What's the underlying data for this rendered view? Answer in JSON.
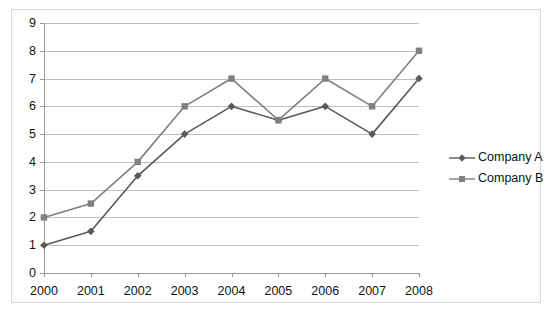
{
  "chart_data": {
    "type": "line",
    "title": "",
    "xlabel": "",
    "ylabel": "",
    "categories": [
      "2000",
      "2001",
      "2002",
      "2003",
      "2004",
      "2005",
      "2006",
      "2007",
      "2008"
    ],
    "series": [
      {
        "name": "Company A",
        "color": "#595959",
        "marker": "diamond",
        "values": [
          1,
          1.5,
          3.5,
          5,
          6,
          5.5,
          6,
          5,
          7
        ]
      },
      {
        "name": "Company B",
        "color": "#808080",
        "marker": "square",
        "values": [
          2,
          2.5,
          4,
          6,
          7,
          5.5,
          7,
          6,
          8
        ]
      }
    ],
    "ylim": [
      0,
      9
    ],
    "y_ticks": [
      "0",
      "1",
      "2",
      "3",
      "4",
      "5",
      "6",
      "7",
      "8",
      "9"
    ],
    "grid": true,
    "legend_position": "right"
  },
  "axes": {
    "y_tick_labels": [
      "9",
      "8",
      "7",
      "6",
      "5",
      "4",
      "3",
      "2",
      "1",
      "0"
    ],
    "x_tick_labels": [
      "2000",
      "2001",
      "2002",
      "2003",
      "2004",
      "2005",
      "2006",
      "2007",
      "2008"
    ]
  },
  "legend": {
    "entries": [
      {
        "label": "Company A"
      },
      {
        "label": "Company B"
      }
    ]
  },
  "colors": {
    "series_a": "#595959",
    "series_b": "#808080",
    "gridline": "#bfbfbf",
    "axis": "#9a9a9a",
    "frame": "#d9d9d9",
    "text": "#111111",
    "background": "#ffffff"
  }
}
